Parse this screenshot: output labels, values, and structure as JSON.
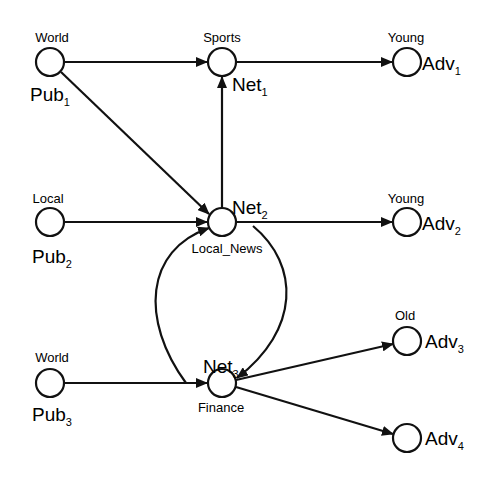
{
  "diagram": {
    "type": "directed-graph",
    "nodes": [
      {
        "id": "pub1",
        "name": "Pub",
        "sub": "1",
        "tag": "World",
        "x": 50,
        "y": 62
      },
      {
        "id": "pub2",
        "name": "Pub",
        "sub": "2",
        "tag": "Local",
        "x": 50,
        "y": 222
      },
      {
        "id": "pub3",
        "name": "Pub",
        "sub": "3",
        "tag": "World",
        "x": 50,
        "y": 383
      },
      {
        "id": "net1",
        "name": "Net",
        "sub": "1",
        "tag": "Sports",
        "x": 222,
        "y": 62
      },
      {
        "id": "net2",
        "name": "Net",
        "sub": "2",
        "tag": "Local_News",
        "x": 222,
        "y": 222
      },
      {
        "id": "net3",
        "name": "Net",
        "sub": "3",
        "tag": "Finance",
        "x": 222,
        "y": 383
      },
      {
        "id": "adv1",
        "name": "Adv",
        "sub": "1",
        "tag": "Young",
        "x": 407,
        "y": 62
      },
      {
        "id": "adv2",
        "name": "Adv",
        "sub": "2",
        "tag": "Young",
        "x": 407,
        "y": 222
      },
      {
        "id": "adv3",
        "name": "Adv",
        "sub": "3",
        "tag": "Old",
        "x": 407,
        "y": 341
      },
      {
        "id": "adv4",
        "name": "Adv",
        "sub": "4",
        "tag": "",
        "x": 407,
        "y": 438
      }
    ],
    "edges": [
      {
        "from": "pub1",
        "to": "net1"
      },
      {
        "from": "pub1",
        "to": "net2"
      },
      {
        "from": "net1",
        "to": "adv1"
      },
      {
        "from": "net2",
        "to": "net1"
      },
      {
        "from": "pub2",
        "to": "net2"
      },
      {
        "from": "net2",
        "to": "adv2"
      },
      {
        "from": "pub3",
        "to": "net3"
      },
      {
        "from": "net3",
        "to": "net2",
        "curve": "left"
      },
      {
        "from": "net2",
        "to": "net3",
        "curve": "right"
      },
      {
        "from": "net3",
        "to": "adv3"
      },
      {
        "from": "net3",
        "to": "adv4"
      }
    ]
  },
  "labels": {
    "pub1_tag": "World",
    "pub1_name": "Pub",
    "pub1_sub": "1",
    "pub2_tag": "Local",
    "pub2_name": "Pub",
    "pub2_sub": "2",
    "pub3_tag": "World",
    "pub3_name": "Pub",
    "pub3_sub": "3",
    "net1_tag": "Sports",
    "net1_name": "Net",
    "net1_sub": "1",
    "net2_tag": "Local_News",
    "net2_name": "Net",
    "net2_sub": "2",
    "net3_tag": "Finance",
    "net3_name": "Net",
    "net3_sub": "3",
    "adv1_tag": "Young",
    "adv1_name": "Adv",
    "adv1_sub": "1",
    "adv2_tag": "Young",
    "adv2_name": "Adv",
    "adv2_sub": "2",
    "adv3_tag": "Old",
    "adv3_name": "Adv",
    "adv3_sub": "3",
    "adv4_name": "Adv",
    "adv4_sub": "4"
  }
}
